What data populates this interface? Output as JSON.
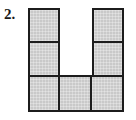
{
  "figure": {
    "item_number": "2.",
    "shape_name": "u-shaped-polyomino",
    "grid": {
      "rows": 3,
      "columns": 3,
      "filled_count": 7
    },
    "cells": [
      {
        "row": 1,
        "col": 1,
        "filled": true,
        "name": "cell-r1c1"
      },
      {
        "row": 1,
        "col": 2,
        "filled": false,
        "name": "cell-r1c2"
      },
      {
        "row": 1,
        "col": 3,
        "filled": true,
        "name": "cell-r1c3"
      },
      {
        "row": 2,
        "col": 1,
        "filled": true,
        "name": "cell-r2c1"
      },
      {
        "row": 2,
        "col": 2,
        "filled": false,
        "name": "cell-r2c2"
      },
      {
        "row": 2,
        "col": 3,
        "filled": true,
        "name": "cell-r2c3"
      },
      {
        "row": 3,
        "col": 1,
        "filled": true,
        "name": "cell-r3c1"
      },
      {
        "row": 3,
        "col": 2,
        "filled": true,
        "name": "cell-r3c2"
      },
      {
        "row": 3,
        "col": 3,
        "filled": true,
        "name": "cell-r3c3"
      }
    ],
    "colors": {
      "cell_fill": "#c9c9c9",
      "cell_border": "#1c1c1c",
      "label_text": "#1a1a1a",
      "background": "#ffffff"
    }
  }
}
